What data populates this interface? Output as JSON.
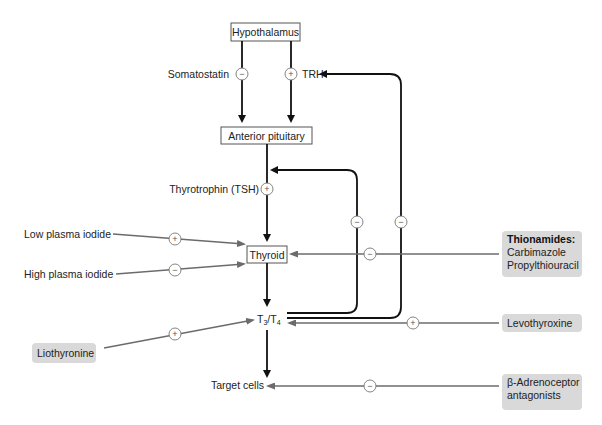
{
  "nodes": {
    "hypothalamus": "Hypothalamus",
    "anterior_pituitary": "Anterior pituitary",
    "thyroid": "Thyroid",
    "t3t4_main": "T",
    "t3_sub": "3",
    "t3t4_slash": "/T",
    "t4_sub": "4",
    "target_cells": "Target cells"
  },
  "labels": {
    "somatostatin": "Somatostatin",
    "trh": "TRH",
    "tsh": "Thyrotrophin (TSH)",
    "low_iodide": "Low plasma iodide",
    "high_iodide": "High plasma iodide"
  },
  "drugs": {
    "thionamides_title": "Thionamides:",
    "thionamides_1": "Carbimazole",
    "thionamides_2": "Propylthiouracil",
    "levothyroxine": "Levothyroxine",
    "liothyronine": "Liothyronine",
    "beta_1": "β-Adrenoceptor",
    "beta_2": "antagonists"
  },
  "signs": {
    "plus": "+",
    "minus": "−"
  },
  "colors": {
    "drug_box": "#d9d9d9",
    "main_arrow": "#111111",
    "drug_arrow": "#6b6b6b"
  }
}
